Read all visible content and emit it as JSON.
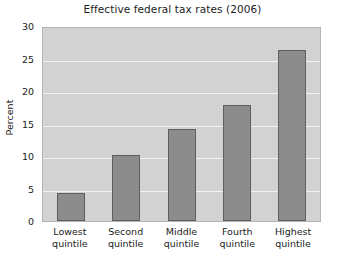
{
  "chart_data": {
    "type": "bar",
    "title": "Effective federal tax rates (2006)",
    "xlabel": "",
    "ylabel": "Percent",
    "categories": [
      "Lowest\nquintile",
      "Second\nquintile",
      "Middle\nquintile",
      "Fourth\nquintile",
      "Highest\nquintile"
    ],
    "values": [
      4.3,
      10.1,
      14.2,
      17.8,
      26.3
    ],
    "ylim": [
      0,
      30
    ],
    "yticks": [
      0,
      5,
      10,
      15,
      20,
      25,
      30
    ],
    "ytick_labels": [
      "0",
      "5",
      "10",
      "15",
      "20",
      "25",
      "30"
    ],
    "grid": true,
    "legend": false,
    "colors": {
      "bar_fill": "#8c8c8c",
      "bar_edge": "#5e5e5e",
      "plot_background": "#d2d2d2",
      "gridline": "#f2f2f2",
      "figure_background": "#ffffff",
      "text": "#1c1c1c"
    }
  }
}
